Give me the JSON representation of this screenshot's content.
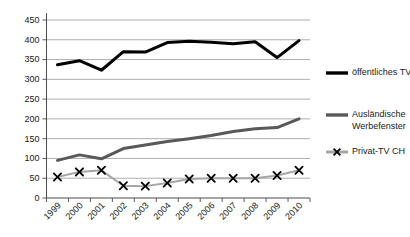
{
  "chart_data": {
    "type": "line",
    "title": "",
    "subtitle": "",
    "xlabel": "",
    "ylabel": "",
    "categories": [
      "1999",
      "2000",
      "2001",
      "2002",
      "2003",
      "2004",
      "2005",
      "2006",
      "2007",
      "2008",
      "2009",
      "2010"
    ],
    "ylim": [
      0,
      450
    ],
    "yticks": [
      0,
      50,
      100,
      150,
      200,
      250,
      300,
      350,
      400,
      450
    ],
    "ytick_labels": [
      "0",
      "50",
      "100",
      "150",
      "200",
      "250",
      "300",
      "350",
      "400",
      "450"
    ],
    "grid": true,
    "legend_position": "right",
    "series": [
      {
        "name": "öffentliches TV",
        "color": "#000000",
        "marker": "none",
        "line_width": 3,
        "values": [
          337,
          347,
          323,
          370,
          369,
          393,
          396,
          394,
          390,
          395,
          355,
          398
        ]
      },
      {
        "name": "Ausländische Werbefenster",
        "color": "#595959",
        "marker": "none",
        "line_width": 3,
        "values": [
          95,
          109,
          99,
          125,
          134,
          143,
          150,
          158,
          168,
          175,
          178,
          200
        ]
      },
      {
        "name": "Privat-TV CH",
        "color": "#a6a6a6",
        "marker": "x",
        "marker_color": "#000000",
        "line_width": 2,
        "values": [
          53,
          66,
          70,
          31,
          30,
          38,
          48,
          50,
          50,
          50,
          57,
          70
        ]
      }
    ]
  },
  "legend": {
    "items": [
      {
        "label": "öffentliches TV",
        "color": "#000000",
        "marker": "none"
      },
      {
        "label_line1": "Ausländische",
        "label_line2": "Werbefenster",
        "color": "#595959",
        "marker": "none"
      },
      {
        "label": "Privat-TV CH",
        "color": "#a6a6a6",
        "marker": "x"
      }
    ]
  }
}
